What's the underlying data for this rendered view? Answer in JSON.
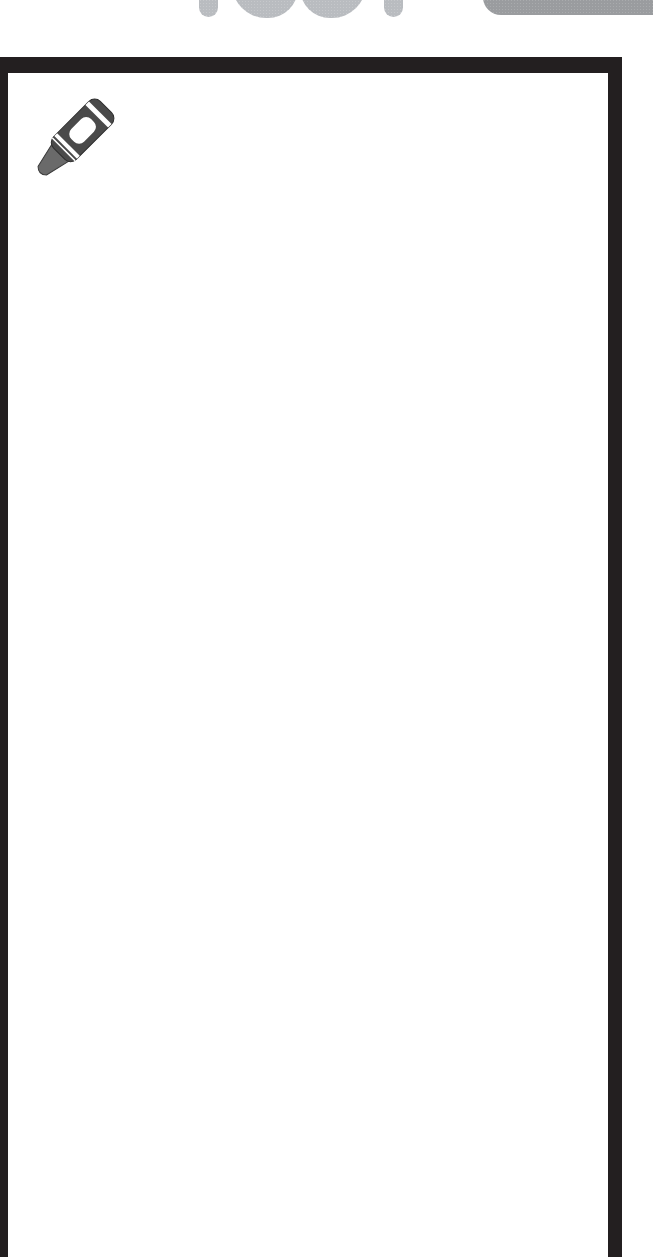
{
  "header": {
    "decorative_title_fragment": "rae!",
    "title_color": "#b9bcc0",
    "tab_color": "#9a9c9f"
  },
  "frame": {
    "border_color": "#231f20",
    "background": "#ffffff",
    "content": ""
  },
  "icons": {
    "crayon": {
      "name": "crayon-icon",
      "body_color": "#4a4a4a",
      "tip_color": "#6a6a6a",
      "band_color": "#ffffff"
    }
  }
}
